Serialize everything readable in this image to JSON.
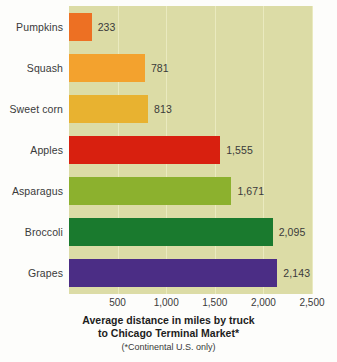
{
  "chart_data": {
    "type": "bar",
    "orientation": "horizontal",
    "title": "",
    "xlabel": "Average distance in miles by truck to Chicago Terminal Market*",
    "ylabel": "",
    "xlim": [
      0,
      2500
    ],
    "xticks": [
      500,
      1000,
      1500,
      2000,
      2500
    ],
    "xtick_labels": [
      "500",
      "1,000",
      "1,500",
      "2,000",
      "2,500"
    ],
    "grid": true,
    "legend": "none",
    "categories": [
      "Pumpkins",
      "Squash",
      "Sweet corn",
      "Apples",
      "Asparagus",
      "Broccoli",
      "Grapes"
    ],
    "values": [
      233,
      781,
      813,
      1555,
      1671,
      2095,
      2143
    ],
    "value_labels": [
      "233",
      "781",
      "813",
      "1,555",
      "1,671",
      "2,095",
      "2,143"
    ],
    "bar_colors": [
      "#ed7023",
      "#f3a22e",
      "#e8b230",
      "#d8200f",
      "#8cb12e",
      "#1a7a2e",
      "#4b2d85"
    ],
    "bars": [
      {
        "category": "Pumpkins",
        "value": 233,
        "value_label": "233",
        "color": "#ed7023"
      },
      {
        "category": "Squash",
        "value": 781,
        "value_label": "781",
        "color": "#f3a22e"
      },
      {
        "category": "Sweet corn",
        "value": 813,
        "value_label": "813",
        "color": "#e8b230"
      },
      {
        "category": "Apples",
        "value": 1555,
        "value_label": "1,555",
        "color": "#d8200f"
      },
      {
        "category": "Asparagus",
        "value": 1671,
        "value_label": "1,671",
        "color": "#8cb12e"
      },
      {
        "category": "Broccoli",
        "value": 2095,
        "value_label": "2,095",
        "color": "#1a7a2e"
      },
      {
        "category": "Grapes",
        "value": 2143,
        "value_label": "2,143",
        "color": "#4b2d85"
      }
    ]
  },
  "caption": {
    "axis_title_line1": "Average distance in miles by truck",
    "axis_title_line2": "to Chicago Terminal Market*",
    "footnote": "(*Continental U.S. only)"
  },
  "style": {
    "plot_background": "#dcdca6",
    "gridline_color": "#eaeabf",
    "page_background": "#fdfdfb",
    "text_color": "#3a3a3a"
  }
}
